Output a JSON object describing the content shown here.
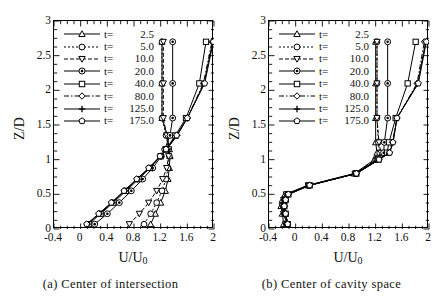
{
  "figure": {
    "panels": [
      {
        "id": "a",
        "caption": "(a) Center of intersection",
        "xlabel": "U/U",
        "xlabel_sub": "0",
        "ylabel": "Z/D"
      },
      {
        "id": "b",
        "caption": "(b) Center of cavity space",
        "xlabel": "U/U",
        "xlabel_sub": "0",
        "ylabel": "Z/D"
      }
    ],
    "legend": [
      {
        "prefix": "t=",
        "value": "2.5",
        "marker": "triangle-up",
        "line": "solid"
      },
      {
        "prefix": "t=",
        "value": "5.0",
        "marker": "circle",
        "line": "dotted"
      },
      {
        "prefix": "t=",
        "value": "10.0",
        "marker": "triangle-down",
        "line": "dashed"
      },
      {
        "prefix": "t=",
        "value": "20.0",
        "marker": "circle-dot",
        "line": "solid"
      },
      {
        "prefix": "t=",
        "value": "40.0",
        "marker": "square",
        "line": "solid"
      },
      {
        "prefix": "t=",
        "value": "80.0",
        "marker": "diamond",
        "line": "dashdot"
      },
      {
        "prefix": "t=",
        "value": "125.0",
        "marker": "plus",
        "line": "solid"
      },
      {
        "prefix": "t=",
        "value": "175.0",
        "marker": "pentagon",
        "line": "solid"
      }
    ]
  },
  "chart_data": [
    {
      "type": "line",
      "panel": "a",
      "title": "(a) Center of intersection",
      "xlabel": "U/U0",
      "ylabel": "Z/D",
      "xlim": [
        -0.4,
        2.0
      ],
      "ylim": [
        0,
        3
      ],
      "xticks": [
        -0.4,
        0,
        0.4,
        0.8,
        1.2,
        1.6,
        2
      ],
      "xticklabels": [
        "-0.4",
        "0",
        "0.4",
        "0.8",
        "1.2",
        "1.6",
        "2"
      ],
      "yticks": [
        0,
        0.5,
        1,
        1.5,
        2,
        2.5,
        3
      ],
      "yticklabels": [
        "0",
        "0.5",
        "1",
        "1.5",
        "2",
        "2.5",
        "3"
      ],
      "grid": false,
      "legend_position": "upper-left",
      "orientation": "y-is-independent",
      "series": [
        {
          "name": "t= 2.5",
          "marker": "triangle-up",
          "line": "solid",
          "z": [
            0.07,
            0.22,
            0.38,
            0.55,
            0.72,
            0.88,
            1.05,
            1.15,
            1.35,
            1.6,
            2.1,
            2.7
          ],
          "u": [
            1.05,
            1.12,
            1.2,
            1.27,
            1.31,
            1.33,
            1.34,
            1.33,
            1.3,
            1.22,
            1.22,
            1.22
          ]
        },
        {
          "name": "t= 5.0",
          "marker": "circle",
          "line": "dotted",
          "z": [
            0.07,
            0.22,
            0.38,
            0.55,
            0.72,
            0.88,
            1.05,
            1.15,
            1.35,
            1.6,
            2.1,
            2.7
          ],
          "u": [
            0.95,
            1.05,
            1.14,
            1.22,
            1.28,
            1.31,
            1.33,
            1.32,
            1.28,
            1.22,
            1.22,
            1.22
          ]
        },
        {
          "name": "t= 10.0",
          "marker": "triangle-down",
          "line": "dashed",
          "z": [
            0.07,
            0.22,
            0.38,
            0.55,
            0.72,
            0.88,
            1.05,
            1.15,
            1.35,
            1.6,
            2.1,
            2.7
          ],
          "u": [
            0.73,
            0.88,
            1.02,
            1.14,
            1.23,
            1.29,
            1.32,
            1.32,
            1.29,
            1.24,
            1.24,
            1.24
          ]
        },
        {
          "name": "t= 20.0",
          "marker": "circle-dot",
          "line": "solid",
          "z": [
            0.07,
            0.22,
            0.38,
            0.55,
            0.72,
            0.88,
            1.05,
            1.15,
            1.35,
            1.6,
            2.1,
            2.7
          ],
          "u": [
            0.21,
            0.4,
            0.58,
            0.76,
            0.93,
            1.08,
            1.21,
            1.26,
            1.34,
            1.38,
            1.38,
            1.38
          ]
        },
        {
          "name": "t= 40.0",
          "marker": "square",
          "line": "solid",
          "z": [
            0.07,
            0.22,
            0.38,
            0.55,
            0.72,
            0.88,
            1.05,
            1.15,
            1.35,
            1.6,
            2.1,
            2.7
          ],
          "u": [
            0.12,
            0.3,
            0.49,
            0.68,
            0.87,
            1.04,
            1.2,
            1.28,
            1.42,
            1.58,
            1.78,
            1.88
          ]
        },
        {
          "name": "t= 80.0",
          "marker": "diamond",
          "line": "dashdot",
          "z": [
            0.07,
            0.22,
            0.38,
            0.55,
            0.72,
            0.88,
            1.05,
            1.15,
            1.35,
            1.6,
            2.1,
            2.7
          ],
          "u": [
            0.1,
            0.28,
            0.47,
            0.66,
            0.85,
            1.03,
            1.2,
            1.29,
            1.44,
            1.6,
            1.84,
            1.97
          ]
        },
        {
          "name": "t=125.0",
          "marker": "plus",
          "line": "solid",
          "z": [
            0.07,
            0.22,
            0.38,
            0.55,
            0.72,
            0.88,
            1.05,
            1.15,
            1.35,
            1.6,
            2.1,
            2.7
          ],
          "u": [
            0.1,
            0.28,
            0.47,
            0.66,
            0.85,
            1.03,
            1.2,
            1.29,
            1.45,
            1.6,
            1.85,
            1.98
          ]
        },
        {
          "name": "t=175.0",
          "marker": "pentagon",
          "line": "solid",
          "z": [
            0.07,
            0.22,
            0.38,
            0.55,
            0.72,
            0.88,
            1.05,
            1.15,
            1.35,
            1.6,
            2.1,
            2.7
          ],
          "u": [
            0.09,
            0.27,
            0.46,
            0.65,
            0.84,
            1.02,
            1.19,
            1.28,
            1.44,
            1.6,
            1.86,
            1.99
          ]
        }
      ]
    },
    {
      "type": "line",
      "panel": "b",
      "title": "(b) Center of cavity space",
      "xlabel": "U/U0",
      "ylabel": "Z/D",
      "xlim": [
        -0.4,
        2.0
      ],
      "ylim": [
        0,
        3
      ],
      "xticks": [
        -0.4,
        0,
        0.4,
        0.8,
        1.2,
        1.6,
        2
      ],
      "xticklabels": [
        "-0.4",
        "0",
        "0.4",
        "0.8",
        "1.2",
        "1.6",
        "2"
      ],
      "yticks": [
        0,
        0.5,
        1,
        1.5,
        2,
        2.5,
        3
      ],
      "yticklabels": [
        "0",
        "0.5",
        "1",
        "1.5",
        "2",
        "2.5",
        "3"
      ],
      "grid": false,
      "legend_position": "upper-left",
      "orientation": "y-is-independent",
      "series": [
        {
          "name": "t= 2.5",
          "marker": "triangle-up",
          "line": "solid",
          "z": [
            0.07,
            0.22,
            0.33,
            0.42,
            0.5,
            0.63,
            0.8,
            1.0,
            1.1,
            1.25,
            1.6,
            2.1,
            2.7
          ],
          "u": [
            -0.18,
            -0.2,
            -0.22,
            -0.2,
            -0.16,
            0.18,
            0.88,
            1.18,
            1.22,
            1.2,
            1.2,
            1.2,
            1.2
          ]
        },
        {
          "name": "t= 5.0",
          "marker": "circle",
          "line": "dotted",
          "z": [
            0.07,
            0.22,
            0.33,
            0.42,
            0.5,
            0.63,
            0.8,
            1.0,
            1.1,
            1.25,
            1.6,
            2.1,
            2.7
          ],
          "u": [
            -0.14,
            -0.17,
            -0.19,
            -0.17,
            -0.13,
            0.19,
            0.89,
            1.2,
            1.26,
            1.24,
            1.22,
            1.22,
            1.22
          ]
        },
        {
          "name": "t= 10.0",
          "marker": "triangle-down",
          "line": "dashed",
          "z": [
            0.07,
            0.22,
            0.33,
            0.42,
            0.5,
            0.63,
            0.8,
            1.0,
            1.1,
            1.25,
            1.6,
            2.1,
            2.7
          ],
          "u": [
            -0.15,
            -0.18,
            -0.2,
            -0.18,
            -0.14,
            0.19,
            0.89,
            1.21,
            1.28,
            1.25,
            1.22,
            1.22,
            1.22
          ]
        },
        {
          "name": "t= 20.0",
          "marker": "circle-dot",
          "line": "solid",
          "z": [
            0.07,
            0.22,
            0.33,
            0.42,
            0.5,
            0.63,
            0.8,
            1.0,
            1.1,
            1.25,
            1.6,
            2.1,
            2.7
          ],
          "u": [
            -0.13,
            -0.16,
            -0.18,
            -0.16,
            -0.12,
            0.2,
            0.9,
            1.22,
            1.32,
            1.33,
            1.38,
            1.38,
            1.38
          ]
        },
        {
          "name": "t= 40.0",
          "marker": "square",
          "line": "solid",
          "z": [
            0.07,
            0.22,
            0.33,
            0.42,
            0.5,
            0.63,
            0.8,
            1.0,
            1.1,
            1.25,
            1.6,
            2.1,
            2.7
          ],
          "u": [
            -0.12,
            -0.15,
            -0.17,
            -0.15,
            -0.11,
            0.21,
            0.91,
            1.24,
            1.37,
            1.4,
            1.5,
            1.68,
            1.8
          ]
        },
        {
          "name": "t= 80.0",
          "marker": "diamond",
          "line": "dashdot",
          "z": [
            0.07,
            0.22,
            0.33,
            0.42,
            0.5,
            0.63,
            0.8,
            1.0,
            1.1,
            1.25,
            1.6,
            2.1,
            2.7
          ],
          "u": [
            -0.12,
            -0.15,
            -0.17,
            -0.15,
            -0.11,
            0.21,
            0.91,
            1.25,
            1.4,
            1.45,
            1.52,
            1.82,
            1.93
          ]
        },
        {
          "name": "t=125.0",
          "marker": "plus",
          "line": "solid",
          "z": [
            0.07,
            0.22,
            0.33,
            0.42,
            0.5,
            0.63,
            0.8,
            1.0,
            1.1,
            1.25,
            1.6,
            2.1,
            2.7
          ],
          "u": [
            -0.12,
            -0.15,
            -0.17,
            -0.15,
            -0.11,
            0.21,
            0.91,
            1.25,
            1.41,
            1.46,
            1.52,
            1.83,
            1.95
          ]
        },
        {
          "name": "t=175.0",
          "marker": "pentagon",
          "line": "solid",
          "z": [
            0.07,
            0.22,
            0.33,
            0.42,
            0.5,
            0.63,
            0.8,
            1.0,
            1.1,
            1.25,
            1.6,
            2.1,
            2.7
          ],
          "u": [
            -0.12,
            -0.15,
            -0.17,
            -0.15,
            -0.11,
            0.21,
            0.91,
            1.25,
            1.41,
            1.46,
            1.52,
            1.84,
            1.96
          ]
        }
      ]
    }
  ]
}
